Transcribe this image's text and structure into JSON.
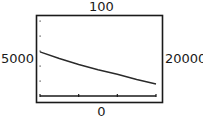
{
  "window": {
    "ymax_label": "100",
    "ymin_label": "0",
    "xmin_label": "5000",
    "xmax_label": "20000"
  },
  "chart_data": {
    "type": "line",
    "title": "",
    "xlabel": "",
    "ylabel": "",
    "xlim": [
      5000,
      20000
    ],
    "ylim": [
      0,
      100
    ],
    "x_ticks": [
      5000,
      10000,
      15000,
      20000
    ],
    "y_ticks": [
      20,
      40,
      60,
      80,
      100
    ],
    "grid": false,
    "legend": null,
    "series": [
      {
        "name": "curve",
        "x": [
          5000,
          7500,
          10000,
          12500,
          15000,
          17500,
          20000
        ],
        "y": [
          59,
          50,
          42,
          35,
          29,
          22,
          16
        ]
      }
    ]
  },
  "colors": {
    "frame": "#1a1a1a",
    "curve": "#2a2a2a",
    "background": "#ffffff"
  }
}
